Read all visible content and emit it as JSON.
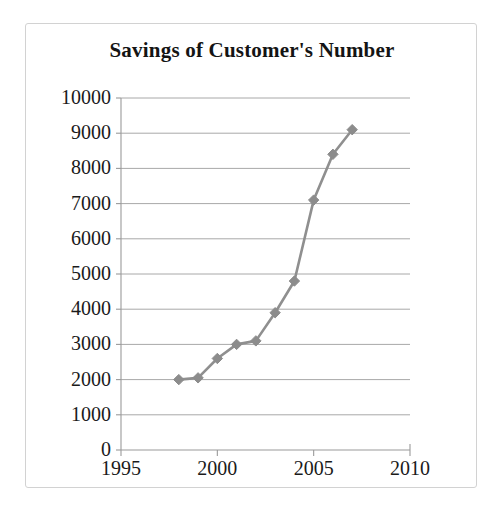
{
  "chart_data": {
    "type": "line",
    "title": "Savings of Customer's Number",
    "xlabel": "",
    "ylabel": "",
    "x": [
      1998,
      1999,
      2000,
      2001,
      2002,
      2003,
      2004,
      2005,
      2006,
      2007
    ],
    "values": [
      2000,
      2050,
      2600,
      3000,
      3100,
      3900,
      4800,
      7100,
      8400,
      9100
    ],
    "series": [
      {
        "name": "Savings of Customer's Number",
        "values": [
          2000,
          2050,
          2600,
          3000,
          3100,
          3900,
          4800,
          7100,
          8400,
          9100
        ]
      }
    ],
    "xlim": [
      1995,
      2010
    ],
    "ylim": [
      0,
      10000
    ],
    "x_ticks": [
      1995,
      2000,
      2005,
      2010
    ],
    "x_tick_labels": [
      "1995",
      "2000",
      "2005",
      "2010"
    ],
    "y_ticks": [
      0,
      1000,
      2000,
      3000,
      4000,
      5000,
      6000,
      7000,
      8000,
      9000,
      10000
    ],
    "y_tick_labels": [
      "0",
      "1000",
      "2000",
      "3000",
      "4000",
      "5000",
      "6000",
      "7000",
      "8000",
      "9000",
      "10000"
    ],
    "grid": "horizontal",
    "legend": "none",
    "marker": "diamond",
    "colors": {
      "line": "#8f8f8f",
      "marker": "#8c8c8c",
      "gridline": "#a8a8a8",
      "axis": "#9a9a9a",
      "text": "#1a1a1a",
      "frame_border": "#d2d2d2",
      "background": "#ffffff"
    }
  }
}
